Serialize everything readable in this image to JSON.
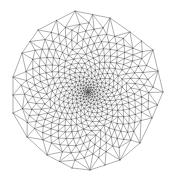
{
  "diagram": {
    "type": "triangulated-mesh",
    "colors": {
      "background": "#ffffff",
      "edge": "#6e6e6e",
      "node": "#4a4a4a"
    },
    "stroke_width": 0.55,
    "node_radius": 0.55,
    "center": [
      88,
      92
    ],
    "boundary": [
      [
        75,
        11
      ],
      [
        110,
        18
      ],
      [
        130,
        32
      ],
      [
        153,
        50
      ],
      [
        163,
        92
      ],
      [
        152,
        118
      ],
      [
        140,
        143
      ],
      [
        120,
        160
      ],
      [
        90,
        170
      ],
      [
        72,
        168
      ],
      [
        47,
        155
      ],
      [
        27,
        137
      ],
      [
        13,
        113
      ],
      [
        13,
        77
      ],
      [
        22,
        53
      ],
      [
        38,
        30
      ]
    ],
    "interior_generation": {
      "count": 420,
      "power": 1.9,
      "golden_angle_deg": 137.508
    }
  }
}
